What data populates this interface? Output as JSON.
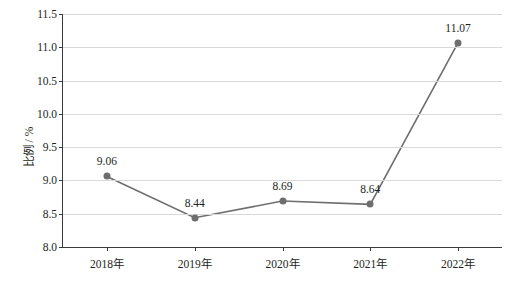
{
  "chart_data": {
    "type": "line",
    "title": "",
    "xlabel": "",
    "ylabel": "比例 / %",
    "categories": [
      "2018年",
      "2019年",
      "2020年",
      "2021年",
      "2022年"
    ],
    "values": [
      9.06,
      8.44,
      8.69,
      8.64,
      11.07
    ],
    "data_labels": [
      "9.06",
      "8.44",
      "8.69",
      "8.64",
      "11.07"
    ],
    "ylim": [
      8.0,
      11.5
    ],
    "yticks": [
      8.0,
      8.5,
      9.0,
      9.5,
      10.0,
      10.5,
      11.0,
      11.5
    ],
    "ytick_labels": [
      "8.0",
      "8.5",
      "9.0",
      "9.5",
      "10.0",
      "10.5",
      "11.0",
      "11.5"
    ],
    "grid": "horizontal",
    "legend": "none",
    "series_color": "#6e6e6e",
    "grid_color": "#d9d9d9",
    "axis_color": "#3a3a3a",
    "text_color": "#231f20"
  }
}
